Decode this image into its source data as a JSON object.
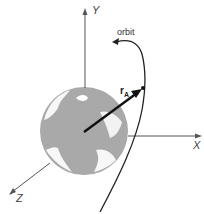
{
  "diagram": {
    "axes": {
      "x_label": "X",
      "y_label": "Y",
      "z_label": "Z"
    },
    "orbit_label": "orbit",
    "vector_label": "r",
    "vector_subscript": "A",
    "colors": {
      "earth": "#a6a6a6",
      "axes": "#555555",
      "vector": "#111111",
      "orbit": "#222222"
    }
  }
}
